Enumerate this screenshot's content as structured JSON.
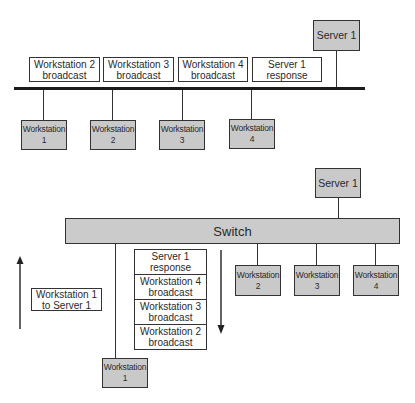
{
  "top_diagram": {
    "type": "shared-bus",
    "server": {
      "label": "Server 1"
    },
    "frames_on_bus": [
      {
        "line1": "Workstation 2",
        "line2": "broadcast"
      },
      {
        "line1": "Workstation 3",
        "line2": "broadcast"
      },
      {
        "line1": "Workstation 4",
        "line2": "broadcast"
      },
      {
        "line1": "Server 1",
        "line2": "response"
      }
    ],
    "workstations": [
      {
        "line1": "Workstation",
        "line2": "1"
      },
      {
        "line1": "Workstation",
        "line2": "2"
      },
      {
        "line1": "Workstation",
        "line2": "3"
      },
      {
        "line1": "Workstation",
        "line2": "4"
      }
    ]
  },
  "bottom_diagram": {
    "type": "switched",
    "server": {
      "label": "Server 1"
    },
    "switch": {
      "label": "Switch"
    },
    "outbound_frame": {
      "line1": "Workstation 1",
      "line2": "to Server 1"
    },
    "inbound_frames": [
      {
        "line1": "Server 1",
        "line2": "response"
      },
      {
        "line1": "Workstation 4",
        "line2": "broadcast"
      },
      {
        "line1": "Workstation 3",
        "line2": "broadcast"
      },
      {
        "line1": "Workstation 2",
        "line2": "broadcast"
      }
    ],
    "workstation_1": {
      "line1": "Workstation",
      "line2": "1"
    },
    "other_workstations": [
      {
        "line1": "Workstation",
        "line2": "2"
      },
      {
        "line1": "Workstation",
        "line2": "3"
      },
      {
        "line1": "Workstation",
        "line2": "4"
      }
    ],
    "arrows": {
      "up": "outbound-direction",
      "down": "inbound-direction"
    }
  },
  "colors": {
    "node_fill": "#c9c9c9",
    "border": "#333333",
    "background": "#ffffff"
  }
}
